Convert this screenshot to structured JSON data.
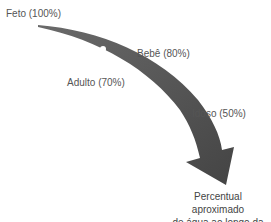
{
  "diagram": {
    "type": "curved-arrow-timeline",
    "arrow_color": "#4a4a4a",
    "dot_color": "#ffffff",
    "stages": [
      {
        "label": "Feto (100%)",
        "stage": "Feto",
        "value": 100
      },
      {
        "label": "Bebê (80%)",
        "stage": "Bebê",
        "value": 80
      },
      {
        "label": "Adulto (70%)",
        "stage": "Adulto",
        "value": 70
      },
      {
        "label": "Idoso (50%)",
        "stage": "Idoso",
        "value": 50
      }
    ],
    "caption_line1": "Percentual aproximado",
    "caption_line2": "de água ao longo da vida"
  }
}
